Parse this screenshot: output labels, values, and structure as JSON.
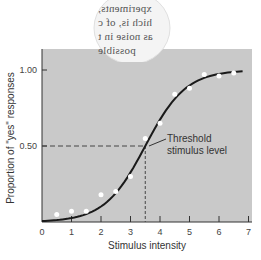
{
  "overlay_text": {
    "lines": [
      "xperiments,",
      "hich is, of c",
      "as noise in t",
      "possible"
    ]
  },
  "chart_data": {
    "type": "scatter",
    "title": "",
    "xlabel": "Stimulus intensity",
    "ylabel": "Proportion of \"yes\" responses",
    "xlim": [
      0,
      7
    ],
    "ylim": [
      0,
      1.0
    ],
    "x_ticks": [
      "0",
      "1",
      "2",
      "3",
      "4",
      "5",
      "6",
      "7"
    ],
    "y_ticks": [
      "0.50",
      "1.00"
    ],
    "grid": false,
    "legend": null,
    "series": [
      {
        "name": "Observed responses",
        "type": "scatter",
        "x": [
          0.5,
          1.0,
          1.5,
          2.0,
          2.5,
          3.0,
          3.5,
          4.0,
          4.5,
          5.0,
          5.5,
          6.0,
          6.5
        ],
        "y": [
          0.05,
          0.07,
          0.07,
          0.18,
          0.2,
          0.3,
          0.55,
          0.65,
          0.84,
          0.88,
          0.97,
          0.96,
          0.98
        ]
      },
      {
        "name": "Psychometric function",
        "type": "line",
        "shape": "sigmoid",
        "midpoint_x": 3.5,
        "x_range": [
          0,
          6.8
        ]
      }
    ],
    "annotations": [
      {
        "text": "Threshold stimulus level",
        "x": 3.5,
        "y": 0.5,
        "lines": [
          "Threshold",
          "stimulus level"
        ]
      }
    ],
    "reference_lines": [
      {
        "orientation": "horizontal",
        "y": 0.5,
        "style": "dashed"
      },
      {
        "orientation": "vertical",
        "x": 3.5,
        "style": "dashed"
      }
    ]
  },
  "colors": {
    "plot_background": "#c9c9c9",
    "points": "#ffffff",
    "curve": "#1a1a1a",
    "text": "#333333"
  }
}
